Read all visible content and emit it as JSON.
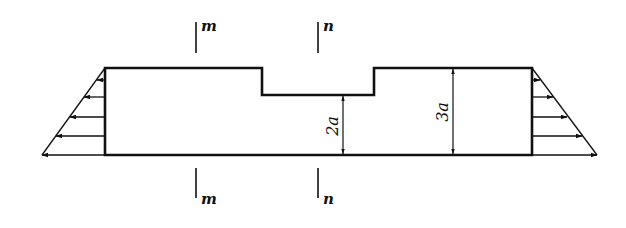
{
  "diagram": {
    "type": "stepped bar with triangular distributed edge loads",
    "body": {
      "outline_color": "#111111",
      "notch": "rectangular notch cut from top middle"
    },
    "sections": [
      {
        "id": "m",
        "top_label": "m",
        "bottom_label": "m"
      },
      {
        "id": "n",
        "top_label": "n",
        "bottom_label": "n"
      }
    ],
    "dimensions": [
      {
        "id": "reduced-height",
        "label": "2a"
      },
      {
        "id": "full-height",
        "label": "3a"
      }
    ],
    "loads": [
      {
        "side": "left",
        "direction": "leftward",
        "distribution": "linear, zero at top, max at bottom",
        "arrow_count": 5
      },
      {
        "side": "right",
        "direction": "rightward",
        "distribution": "linear, zero at top, max at bottom",
        "arrow_count": 5
      }
    ]
  }
}
